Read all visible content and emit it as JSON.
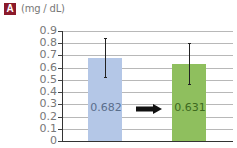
{
  "panel_label": "A",
  "unit_label": "(mg / dL)",
  "colors": {
    "badge": "#8b1a2b",
    "bar1": "#b4c7e7",
    "bar2": "#8fbf5e",
    "bar1_label": "#5a6e8c",
    "bar2_label": "#3d6a1e"
  },
  "chart_data": {
    "type": "bar",
    "title": "",
    "panel": "A",
    "xlabel": "",
    "ylabel": "(mg / dL)",
    "ylim": [
      0,
      0.9
    ],
    "yticks": [
      "0.9",
      "0.8",
      "0.7",
      "0.6",
      "0.5",
      "0.4",
      "0.3",
      "0.2",
      "0.1",
      "0"
    ],
    "grid": true,
    "categories": [
      "before",
      "after"
    ],
    "values": [
      0.682,
      0.631
    ],
    "value_labels": [
      "0.682",
      "0.631"
    ],
    "error_bars": [
      {
        "upper": 0.84,
        "lower": 0.52
      },
      {
        "upper": 0.8,
        "lower": 0.47
      }
    ],
    "bar_colors": [
      "#b4c7e7",
      "#8fbf5e"
    ],
    "annotations": [
      "right arrow between bars indicating decrease"
    ],
    "legend": null
  }
}
